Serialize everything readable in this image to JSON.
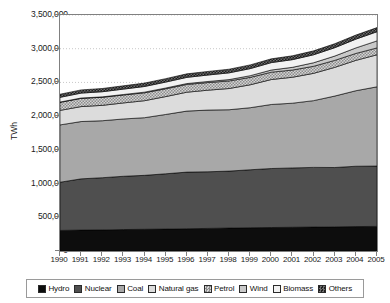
{
  "chart_data": {
    "type": "area",
    "stacked": true,
    "title": "",
    "xlabel": "",
    "ylabel": "TWh",
    "ylim": [
      0,
      3500000
    ],
    "ytick_step": 500000,
    "ytick_labels": [
      "0",
      "500,000",
      "1,000,000",
      "1,500,000",
      "2,000,000",
      "2,500,000",
      "3,000,000",
      "3,500,000"
    ],
    "ytick_values": [
      0,
      500000,
      1000000,
      1500000,
      2000000,
      2500000,
      3000000,
      3500000
    ],
    "grid": "horizontal-dotted",
    "legend_position": "bottom",
    "categories": [
      "1990",
      "1991",
      "1992",
      "1993",
      "1994",
      "1995",
      "1996",
      "1997",
      "1998",
      "1999",
      "2000",
      "2001",
      "2002",
      "2003",
      "2004",
      "2005"
    ],
    "x": [
      1990,
      1991,
      1992,
      1993,
      1994,
      1995,
      1996,
      1997,
      1998,
      1999,
      2000,
      2001,
      2002,
      2003,
      2004,
      2005
    ],
    "series": [
      {
        "name": "Hydro",
        "color": "#0d0d0d",
        "values": [
          305000,
          310000,
          312000,
          318000,
          322000,
          325000,
          330000,
          335000,
          340000,
          345000,
          348000,
          352000,
          355000,
          358000,
          362000,
          365000
        ]
      },
      {
        "name": "Nuclear",
        "color": "#4f4f4f",
        "values": [
          715000,
          760000,
          775000,
          790000,
          800000,
          820000,
          840000,
          840000,
          845000,
          860000,
          875000,
          880000,
          885000,
          880000,
          895000,
          895000
        ]
      },
      {
        "name": "Coal",
        "color": "#a8a8a8",
        "values": [
          850000,
          850000,
          845000,
          850000,
          855000,
          880000,
          905000,
          915000,
          910000,
          920000,
          950000,
          960000,
          990000,
          1060000,
          1120000,
          1175000
        ]
      },
      {
        "name": "Natural gas",
        "color": "#dcdcdc",
        "values": [
          215000,
          222000,
          228000,
          238000,
          252000,
          265000,
          280000,
          295000,
          315000,
          340000,
          370000,
          385000,
          405000,
          425000,
          450000,
          475000
        ]
      },
      {
        "name": "Petrol",
        "color": "#bdbdbd",
        "values": [
          120000,
          122000,
          120000,
          118000,
          118000,
          116000,
          115000,
          113000,
          112000,
          110000,
          109000,
          107000,
          105000,
          104000,
          103000,
          102000
        ]
      },
      {
        "name": "Wind",
        "color": "#c9c9c9",
        "values": [
          4000,
          5000,
          6000,
          7000,
          9000,
          11000,
          13000,
          16000,
          20000,
          25000,
          32000,
          40000,
          52000,
          64000,
          82000,
          104000
        ]
      },
      {
        "name": "Biomass",
        "color": "#f2f2f2",
        "values": [
          70000,
          73000,
          76000,
          80000,
          84000,
          88000,
          92000,
          96000,
          100000,
          105000,
          110000,
          114000,
          118000,
          124000,
          130000,
          136000
        ]
      },
      {
        "name": "Others",
        "color": "#2e2e2e",
        "values": [
          46000,
          47000,
          48000,
          49000,
          50000,
          51000,
          52000,
          53000,
          54000,
          55000,
          56000,
          57000,
          58000,
          59000,
          60000,
          61000
        ]
      }
    ],
    "totals": [
      2325000,
      2389000,
      2410000,
      2450000,
      2490000,
      2556000,
      2627000,
      2663000,
      2696000,
      2760000,
      2850000,
      2895000,
      2968000,
      3074000,
      3202000,
      3313000
    ]
  },
  "legend": {
    "items": [
      {
        "label": "Hydro",
        "swatch": "legend-swatch-hydro"
      },
      {
        "label": "Nuclear",
        "swatch": "legend-swatch-nuclear"
      },
      {
        "label": "Coal",
        "swatch": "legend-swatch-coal"
      },
      {
        "label": "Natural gas",
        "swatch": "legend-swatch-natural-gas"
      },
      {
        "label": "Petrol",
        "swatch": "legend-swatch-petrol"
      },
      {
        "label": "Wind",
        "swatch": "legend-swatch-wind"
      },
      {
        "label": "Biomass",
        "swatch": "legend-swatch-biomass"
      },
      {
        "label": "Others",
        "swatch": "legend-swatch-others"
      }
    ]
  }
}
